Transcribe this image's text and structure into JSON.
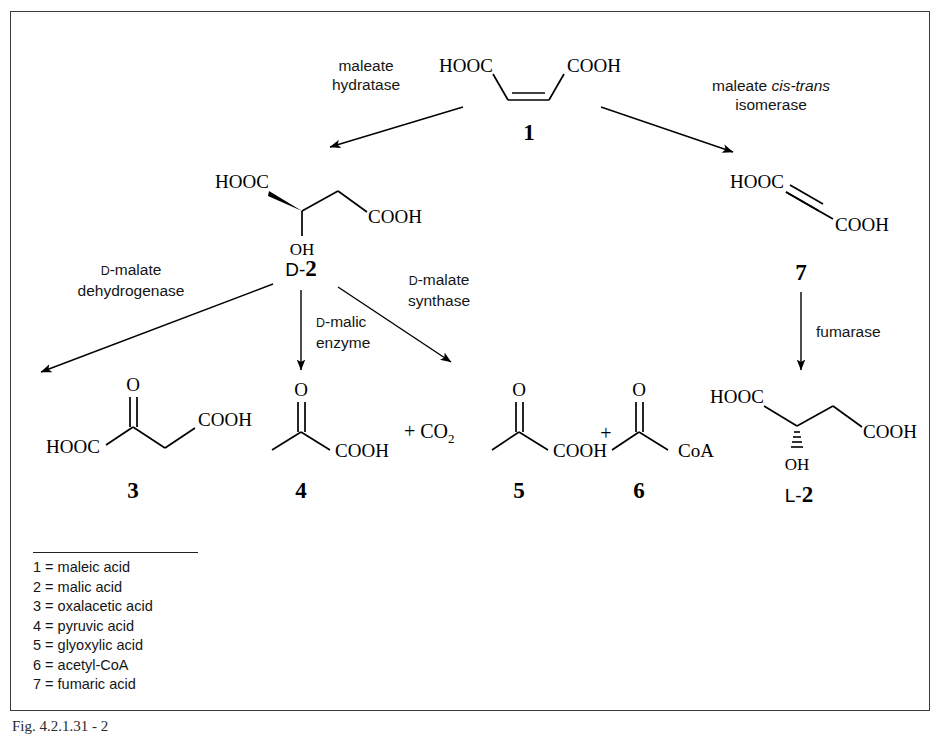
{
  "figure": {
    "caption": "Fig. 4.2.1.31 - 2"
  },
  "compounds": {
    "c1": {
      "number": "1",
      "prefix": "",
      "name": "maleic acid",
      "atoms": [
        "HOOC",
        "COOH"
      ]
    },
    "d2": {
      "number": "2",
      "prefix": "D-",
      "name": "D-malic acid",
      "atoms": [
        "HOOC",
        "COOH",
        "OH"
      ]
    },
    "c7": {
      "number": "7",
      "prefix": "",
      "name": "fumaric acid",
      "atoms": [
        "HOOC",
        "COOH"
      ]
    },
    "c3": {
      "number": "3",
      "prefix": "",
      "name": "oxalacetic acid",
      "atoms": [
        "HOOC",
        "COOH",
        "O"
      ]
    },
    "c4": {
      "number": "4",
      "prefix": "",
      "name": "pyruvic acid",
      "atoms": [
        "COOH",
        "O"
      ],
      "byproduct": "+ CO",
      "byproduct_sub": "2"
    },
    "c5": {
      "number": "5",
      "prefix": "",
      "name": "glyoxylic acid",
      "atoms": [
        "COOH",
        "O"
      ]
    },
    "c6": {
      "number": "6",
      "prefix": "",
      "name": "acetyl-CoA",
      "atoms": [
        "CoA",
        "O"
      ]
    },
    "l2": {
      "number": "2",
      "prefix": "L-",
      "name": "L-malic acid",
      "atoms": [
        "HOOC",
        "COOH",
        "OH"
      ]
    }
  },
  "enzymes": {
    "maleate_hydratase": {
      "line1": "maleate",
      "line2": "hydratase"
    },
    "maleate_isomerase": {
      "line1a": "maleate ",
      "line1b": "cis-trans",
      "line2": "isomerase"
    },
    "d_malate_dehydrogenase": {
      "line1pre": "D",
      "line1post": "-malate",
      "line2": "dehydrogenase"
    },
    "d_malic_enzyme": {
      "line1pre": "D",
      "line1post": "-malic",
      "line2": "enzyme"
    },
    "d_malate_synthase": {
      "line1pre": "D",
      "line1post": "-malate",
      "line2": "synthase"
    },
    "fumarase": {
      "line1": "fumarase"
    }
  },
  "legend": {
    "items": [
      "1 = maleic acid",
      "2 = malic acid",
      "3 = oxalacetic acid",
      "4 = pyruvic acid",
      "5 = glyoxylic acid",
      "6 = acetyl-CoA",
      "7 = fumaric acid"
    ]
  },
  "colors": {
    "ink": "#000000",
    "frame": "#3a3a3a",
    "background": "#ffffff"
  }
}
